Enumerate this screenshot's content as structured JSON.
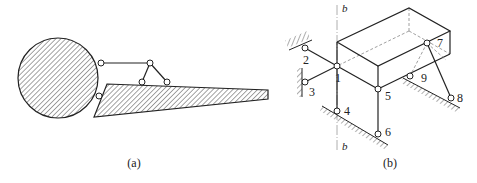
{
  "figure": {
    "panel_a": {
      "caption": "(a)",
      "bodies": [
        "hatched-circle",
        "hatched-wedge"
      ],
      "joints": 5
    },
    "panel_b": {
      "caption": "(b)",
      "axis": {
        "top_label": "b",
        "bottom_label": "b"
      },
      "joint_labels": [
        "1",
        "2",
        "3",
        "4",
        "5",
        "6",
        "7",
        "8",
        "9"
      ]
    }
  },
  "colors": {
    "stroke": "#222222",
    "background": "#ffffff",
    "dashed": "#888888"
  }
}
